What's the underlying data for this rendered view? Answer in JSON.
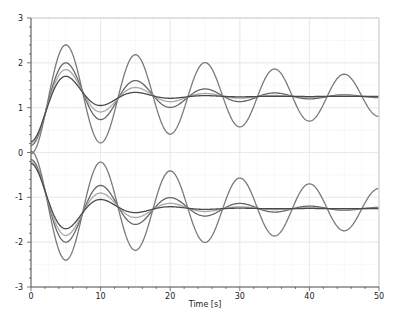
{
  "chart_data": {
    "type": "line",
    "title": "",
    "xlabel": "Time [s]",
    "ylabel": "",
    "xlim": [
      0,
      50
    ],
    "ylim": [
      -3,
      3
    ],
    "xticks": [
      0,
      10,
      20,
      30,
      40,
      50
    ],
    "yticks": [
      -3,
      -2,
      -1,
      0,
      1,
      2,
      3
    ],
    "grid": true,
    "legend": "none",
    "final_value": 1.25,
    "period_s": 10,
    "series": [
      {
        "name": "upper-1",
        "sign": 1,
        "decay": 0.021,
        "color": "#7a7a7a",
        "x": [
          0,
          5,
          10,
          15,
          20,
          25,
          30,
          35,
          40,
          45,
          50
        ],
        "values": [
          0,
          2.4,
          0.23,
          2.18,
          0.4,
          2.0,
          0.55,
          1.88,
          0.66,
          1.75,
          0.78
        ]
      },
      {
        "name": "upper-2",
        "sign": 1,
        "decay": 0.075,
        "color": "#666666",
        "x": [
          0,
          5,
          10,
          15,
          20,
          25,
          30,
          35,
          40,
          45,
          50
        ],
        "values": [
          0,
          2.0,
          0.8,
          1.53,
          1.1,
          1.33,
          1.2,
          1.27,
          1.24,
          1.25,
          1.25
        ]
      },
      {
        "name": "upper-3",
        "sign": 1,
        "decay": 0.11,
        "color": "#a8a8a8",
        "x": [
          0,
          5,
          10,
          15,
          20,
          25,
          30,
          35,
          40,
          45,
          50
        ],
        "values": [
          0,
          1.85,
          0.95,
          1.42,
          1.18,
          1.28,
          1.24,
          1.25,
          1.25,
          1.25,
          1.25
        ]
      },
      {
        "name": "upper-4",
        "sign": 1,
        "decay": 0.16,
        "color": "#4a4a4a",
        "x": [
          0,
          5,
          10,
          15,
          20,
          25,
          30,
          35,
          40,
          45,
          50
        ],
        "values": [
          0,
          1.7,
          1.1,
          1.32,
          1.22,
          1.26,
          1.25,
          1.25,
          1.25,
          1.25,
          1.25
        ]
      },
      {
        "name": "lower-1",
        "sign": -1,
        "decay": 0.021,
        "color": "#7a7a7a",
        "x": [
          0,
          5,
          10,
          15,
          20,
          25,
          30,
          35,
          40,
          45,
          50
        ],
        "values": [
          0,
          -2.4,
          -0.23,
          -2.18,
          -0.4,
          -2.0,
          -0.55,
          -1.88,
          -0.66,
          -1.75,
          -0.78
        ]
      },
      {
        "name": "lower-2",
        "sign": -1,
        "decay": 0.075,
        "color": "#666666",
        "x": [
          0,
          5,
          10,
          15,
          20,
          25,
          30,
          35,
          40,
          45,
          50
        ],
        "values": [
          0,
          -2.0,
          -0.8,
          -1.53,
          -1.1,
          -1.33,
          -1.2,
          -1.27,
          -1.24,
          -1.25,
          -1.25
        ]
      },
      {
        "name": "lower-3",
        "sign": -1,
        "decay": 0.11,
        "color": "#a8a8a8",
        "x": [
          0,
          5,
          10,
          15,
          20,
          25,
          30,
          35,
          40,
          45,
          50
        ],
        "values": [
          0,
          -1.85,
          -0.95,
          -1.42,
          -1.18,
          -1.28,
          -1.24,
          -1.25,
          -1.25,
          -1.25,
          -1.25
        ]
      },
      {
        "name": "lower-4",
        "sign": -1,
        "decay": 0.16,
        "color": "#4a4a4a",
        "x": [
          0,
          5,
          10,
          15,
          20,
          25,
          30,
          35,
          40,
          45,
          50
        ],
        "values": [
          0,
          -1.7,
          -1.1,
          -1.32,
          -1.22,
          -1.26,
          -1.25,
          -1.25,
          -1.25,
          -1.25,
          -1.25
        ]
      }
    ]
  },
  "style": {
    "grid_color": "#e6e6e6",
    "minor_grid_color": "#f3f3f3",
    "axis_color": "#555555",
    "frame_color": "#d0d0d0"
  }
}
